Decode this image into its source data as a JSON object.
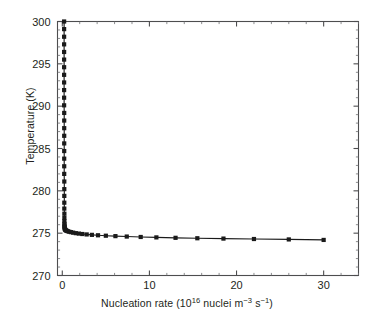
{
  "figure": {
    "background": "#ffffff",
    "frame_color": "#4d4d4f",
    "data_color": "#1a1a1a"
  },
  "axes": {
    "y_label_text": "Temperature (K)",
    "x_label_prefix": "Nucleation rate (10",
    "x_label_exp1": "16",
    "x_label_mid": " nuclei m",
    "x_label_exp2": "−3",
    "x_label_mid2": " s",
    "x_label_exp3": "−1",
    "x_label_suffix": ")",
    "x_ticks": [
      "0",
      "10",
      "20",
      "30"
    ],
    "y_ticks": [
      "270",
      "275",
      "280",
      "285",
      "290",
      "295",
      "300"
    ]
  },
  "chart_data": {
    "type": "line",
    "title": "",
    "subtitle": "",
    "xlabel": "Nucleation rate (10^16 nuclei m^-3 s^-1)",
    "ylabel": "Temperature (K)",
    "xlim": [
      -0.55,
      34.0
    ],
    "ylim": [
      270,
      300
    ],
    "xticks": [
      0,
      10,
      20,
      30
    ],
    "yticks": [
      270,
      275,
      280,
      285,
      290,
      295,
      300
    ],
    "x_minor_tick_step": 2,
    "y_minor_tick_step": 1,
    "grid": false,
    "legend": null,
    "annotations": [],
    "series": [
      {
        "name": "Nucleation rate vs temperature",
        "marker": "square",
        "marker_size": 2.1,
        "line_width": 1.15,
        "comment": "Steeply decaying curve: near-vertical asymptote at low nucleation rate near 0.25, then a long shallow tail from ~275.4 K down to ~274.2 K at rate 30.",
        "x": [
          0.21,
          0.21,
          0.21,
          0.21,
          0.21,
          0.21,
          0.21,
          0.21,
          0.21,
          0.21,
          0.21,
          0.21,
          0.22,
          0.22,
          0.22,
          0.22,
          0.22,
          0.22,
          0.22,
          0.22,
          0.22,
          0.23,
          0.23,
          0.23,
          0.23,
          0.23,
          0.24,
          0.24,
          0.24,
          0.25,
          0.25,
          0.26,
          0.27,
          0.28,
          0.3,
          0.33,
          0.37,
          0.43,
          0.52,
          0.64,
          0.8,
          1.0,
          1.25,
          1.55,
          1.9,
          2.3,
          2.8,
          3.4,
          4.1,
          5.0,
          6.1,
          7.4,
          9.0,
          10.8,
          13.0,
          15.5,
          18.5,
          22.0,
          26.0,
          30.0
        ],
        "y": [
          300.0,
          299.1,
          298.2,
          297.3,
          296.4,
          295.5,
          294.6,
          293.7,
          292.8,
          291.9,
          291.0,
          290.1,
          289.2,
          288.3,
          287.4,
          286.5,
          285.6,
          284.7,
          283.8,
          282.9,
          282.0,
          281.1,
          280.2,
          279.4,
          278.6,
          277.9,
          277.3,
          276.8,
          276.4,
          276.1,
          275.9,
          275.75,
          275.65,
          275.55,
          275.48,
          275.42,
          275.37,
          275.32,
          275.27,
          275.22,
          275.17,
          275.12,
          275.06,
          275.0,
          274.95,
          274.9,
          274.85,
          274.8,
          274.75,
          274.7,
          274.65,
          274.6,
          274.55,
          274.5,
          274.45,
          274.4,
          274.36,
          274.31,
          274.26,
          274.2
        ],
        "n_points": 60
      }
    ]
  }
}
